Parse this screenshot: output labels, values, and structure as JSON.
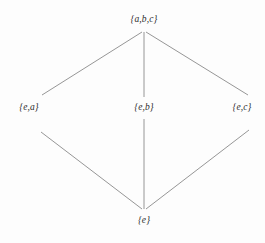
{
  "diagram": {
    "kind": "hasse-diagram",
    "title": "",
    "background_color": "#fdfdfd",
    "line_color": "#8a8a8a",
    "text_color": "#2b2b2b",
    "nodes": [
      {
        "id": "top",
        "label": "{a,b,c}",
        "x": 144,
        "y": 20,
        "vertex_x": 144,
        "vertex_y": 31
      },
      {
        "id": "left",
        "label": "{e,a}",
        "x": 29,
        "y": 108,
        "vertex_x": 38,
        "vertex_y": 108
      },
      {
        "id": "mid",
        "label": "{e,b}",
        "x": 144,
        "y": 108,
        "vertex_x": 144,
        "vertex_y": 108
      },
      {
        "id": "right",
        "label": "{e,c}",
        "x": 242,
        "y": 108,
        "vertex_x": 248,
        "vertex_y": 108
      },
      {
        "id": "bottom",
        "label": "{e}",
        "x": 144,
        "y": 221,
        "vertex_x": 144,
        "vertex_y": 210
      }
    ],
    "edges": [
      {
        "from": "top",
        "to": "left",
        "x1": 142,
        "y1": 32,
        "x2": 42,
        "y2": 95
      },
      {
        "from": "top",
        "to": "mid",
        "x1": 144,
        "y1": 32,
        "x2": 144,
        "y2": 97
      },
      {
        "from": "top",
        "to": "right",
        "x1": 146,
        "y1": 32,
        "x2": 248,
        "y2": 95
      },
      {
        "from": "left",
        "to": "bottom",
        "x1": 41,
        "y1": 132,
        "x2": 142,
        "y2": 209
      },
      {
        "from": "mid",
        "to": "bottom",
        "x1": 144,
        "y1": 119,
        "x2": 144,
        "y2": 209
      },
      {
        "from": "right",
        "to": "bottom",
        "x1": 249,
        "y1": 130,
        "x2": 146,
        "y2": 209
      }
    ]
  }
}
